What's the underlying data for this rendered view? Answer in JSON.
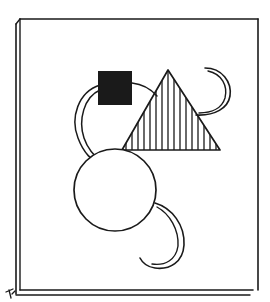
{
  "artwork": {
    "description": "Line-art illustration of a framed canvas with abstract geometric shapes",
    "colors": {
      "ink": "#1a1a1a",
      "paper": "#ffffff",
      "fill_square": "#1a1a1a"
    },
    "frame": {
      "left": 20,
      "top": 19,
      "right": 258,
      "bottom": 290
    },
    "shapes": [
      {
        "type": "square",
        "fill": "solid-black",
        "x": 98,
        "y": 71,
        "size": 34
      },
      {
        "type": "triangle",
        "fill": "vertical-hatch",
        "points": [
          [
            168,
            70
          ],
          [
            122,
            150
          ],
          [
            220,
            150
          ]
        ]
      },
      {
        "type": "circle",
        "fill": "none",
        "cx": 115,
        "cy": 190,
        "r": 41
      },
      {
        "type": "double-arc",
        "position": "left-of-square"
      },
      {
        "type": "double-arc",
        "position": "top-right-crescent"
      },
      {
        "type": "double-arc",
        "position": "bottom-right-crescent"
      }
    ],
    "corner_mark": "pen-nib"
  }
}
